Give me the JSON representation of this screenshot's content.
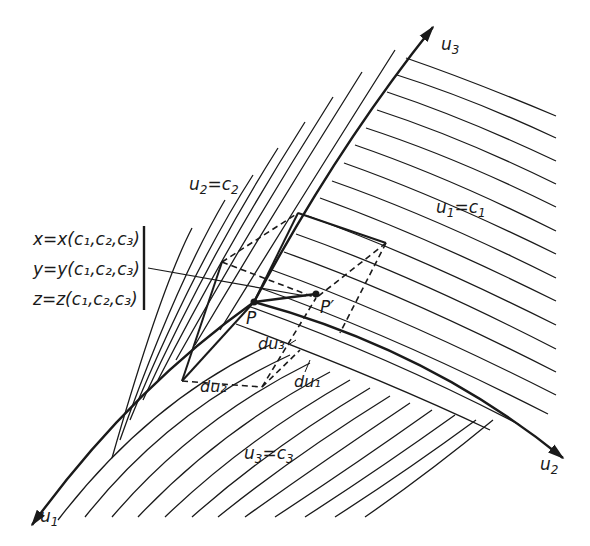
{
  "diagram": {
    "type": "curvilinear-coordinate-system",
    "axes": {
      "u1": {
        "label": "u",
        "sub": "1"
      },
      "u2": {
        "label": "u",
        "sub": "2"
      },
      "u3": {
        "label": "u",
        "sub": "3"
      }
    },
    "surfaces": {
      "u1_const": {
        "label": "u",
        "sub": "1",
        "eq": "=",
        "c": "c",
        "csub": "1"
      },
      "u2_const": {
        "label": "u",
        "sub": "2",
        "eq": "=",
        "c": "c",
        "csub": "2"
      },
      "u3_const": {
        "label": "u",
        "sub": "3",
        "eq": "=",
        "c": "c",
        "csub": "3"
      }
    },
    "equations": [
      {
        "text": "x=x(c₁,c₂,c₃)"
      },
      {
        "text": "y=y(c₁,c₂,c₃)"
      },
      {
        "text": "z=z(c₁,c₂,c₃)"
      }
    ],
    "points": {
      "P": "P",
      "P_prime": "P′"
    },
    "differentials": {
      "du1": "du₁",
      "du2": "du₂",
      "du3": "du₃"
    },
    "colors": {
      "ink": "#1a1a1a",
      "background": "#ffffff"
    }
  }
}
